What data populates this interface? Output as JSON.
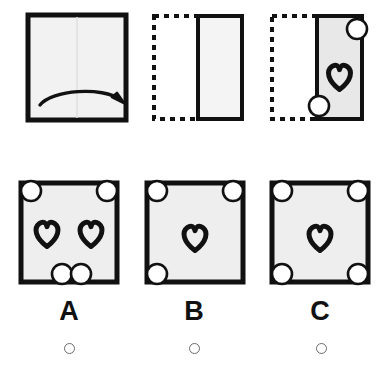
{
  "puzzle": {
    "type": "paper-folding-hole-punch",
    "prompt_panels": [
      {
        "id": "panel-1",
        "name": "unfolded-sheet-with-fold-arrow",
        "shape": "square",
        "outline": "solid",
        "fill_color": "#f2f2f2",
        "stroke_color": "#111111",
        "fold_line": "vertical-center",
        "arrow": "curved-left-to-right",
        "holes": [],
        "hearts": []
      },
      {
        "id": "panel-2",
        "name": "folded-sheet-blank",
        "shape": "rectangle-right-half",
        "outline": "solid",
        "ghost_outline": "dashed-left-half",
        "fill_color": "#f4f4f4",
        "stroke_color": "#111111",
        "holes": [],
        "hearts": []
      },
      {
        "id": "panel-3",
        "name": "folded-sheet-punched",
        "shape": "rectangle-right-half",
        "outline": "solid",
        "ghost_outline": "dashed-left-half",
        "fill_color": "#e8e8e8",
        "stroke_color": "#111111",
        "holes": [
          "top-right-corner",
          "bottom-left-on-fold"
        ],
        "hearts": [
          "center"
        ]
      }
    ],
    "options": [
      {
        "id": "option-a",
        "label": "A",
        "selected": false,
        "fill_color": "#eeeeee",
        "stroke_color": "#111111",
        "hearts": [
          "left-of-center",
          "right-of-center"
        ],
        "holes": [
          "top-left-corner",
          "top-right-corner",
          "bottom-center-left",
          "bottom-center-right"
        ]
      },
      {
        "id": "option-b",
        "label": "B",
        "selected": false,
        "fill_color": "#eeeeee",
        "stroke_color": "#111111",
        "hearts": [
          "center"
        ],
        "holes": [
          "top-left-corner",
          "top-right-corner",
          "bottom-left-corner"
        ]
      },
      {
        "id": "option-c",
        "label": "C",
        "selected": false,
        "fill_color": "#eeeeee",
        "stroke_color": "#111111",
        "hearts": [
          "center"
        ],
        "holes": [
          "top-left-corner",
          "top-right-corner",
          "bottom-left-corner",
          "bottom-right-corner"
        ]
      }
    ],
    "colors": {
      "ink": "#111111",
      "paper": "#efefef",
      "hole": "#ffffff",
      "radio_border": "#6b6b6b",
      "background": "#ffffff"
    }
  }
}
